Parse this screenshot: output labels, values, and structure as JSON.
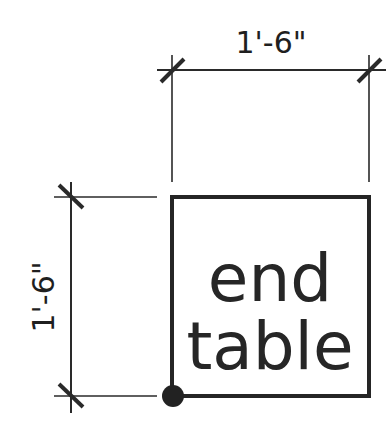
{
  "drawing": {
    "object_label_line1": "end",
    "object_label_line2": "table",
    "width_dimension": "1'-6\"",
    "depth_dimension": "1'-6\""
  },
  "colors": {
    "ink": "#222222",
    "background": "#ffffff"
  }
}
